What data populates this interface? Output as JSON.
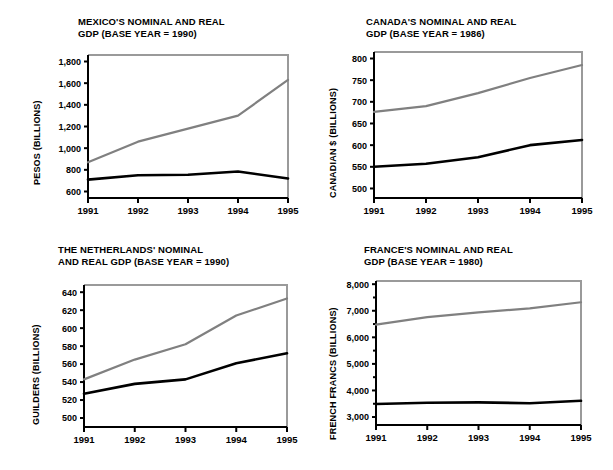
{
  "figure": {
    "background_color": "#ffffff",
    "nominal_series_color": "#808080",
    "real_series_color": "#000000",
    "axis_color": "#000000",
    "frame_color": "#9a9a9a"
  },
  "charts": [
    {
      "id": "mexico",
      "position": "top-left",
      "title": "MEXICO'S NOMINAL AND REAL\nGDP (BASE YEAR = 1990)",
      "ylabel": "PESOS (BILLIONS)",
      "xticklabels": [
        "1991",
        "1992",
        "1993",
        "1994",
        "1995"
      ],
      "yticklabels": [
        "600",
        "800",
        "1,000",
        "1,200",
        "1,400",
        "1,600",
        "1,800"
      ]
    },
    {
      "id": "canada",
      "position": "top-right",
      "title": "CANADA'S NOMINAL AND REAL\nGDP (BASE YEAR = 1986)",
      "ylabel": "CANADIAN $ (BILLIONS)",
      "xticklabels": [
        "1991",
        "1992",
        "1993",
        "1994",
        "1995"
      ],
      "yticklabels": [
        "500",
        "550",
        "600",
        "650",
        "700",
        "750",
        "800"
      ]
    },
    {
      "id": "netherlands",
      "position": "bottom-left",
      "title": "THE NETHERLANDS' NOMINAL\nAND REAL GDP (BASE YEAR = 1990)",
      "ylabel": "GUILDERS (BILLIONS)",
      "xticklabels": [
        "1991",
        "1992",
        "1993",
        "1994",
        "1995"
      ],
      "yticklabels": [
        "500",
        "520",
        "540",
        "560",
        "580",
        "600",
        "620",
        "640"
      ]
    },
    {
      "id": "france",
      "position": "bottom-right",
      "title": "FRANCE'S NOMINAL AND REAL\nGDP (BASE YEAR = 1980)",
      "ylabel": "FRENCH FRANCS (BILLIONS)",
      "xticklabels": [
        "1991",
        "1992",
        "1993",
        "1994",
        "1995"
      ],
      "yticklabels": [
        "3,000",
        "4,000",
        "5,000",
        "6,000",
        "7,000",
        "8,000"
      ]
    }
  ],
  "chart_data": [
    {
      "type": "line",
      "id": "mexico",
      "title": "MEXICO'S NOMINAL AND REAL GDP (BASE YEAR = 1990)",
      "xlabel": "",
      "ylabel": "PESOS (BILLIONS)",
      "x": [
        1991,
        1992,
        1993,
        1994,
        1995
      ],
      "categories": [
        "1991",
        "1992",
        "1993",
        "1994",
        "1995"
      ],
      "series": [
        {
          "name": "Nominal GDP",
          "color": "#808080",
          "values": [
            870,
            1060,
            1180,
            1300,
            1630
          ]
        },
        {
          "name": "Real GDP",
          "color": "#000000",
          "values": [
            710,
            750,
            755,
            785,
            720
          ]
        }
      ],
      "ylim": [
        540,
        1860
      ],
      "yticks": [
        600,
        800,
        1000,
        1200,
        1400,
        1600,
        1800
      ],
      "grid": false,
      "legend": "none"
    },
    {
      "type": "line",
      "id": "canada",
      "title": "CANADA'S NOMINAL AND REAL GDP (BASE YEAR = 1986)",
      "xlabel": "",
      "ylabel": "CANADIAN $ (BILLIONS)",
      "x": [
        1991,
        1992,
        1993,
        1994,
        1995
      ],
      "categories": [
        "1991",
        "1992",
        "1993",
        "1994",
        "1995"
      ],
      "series": [
        {
          "name": "Nominal GDP",
          "color": "#808080",
          "values": [
            677,
            690,
            720,
            755,
            785
          ]
        },
        {
          "name": "Real GDP",
          "color": "#000000",
          "values": [
            550,
            557,
            572,
            600,
            612
          ]
        }
      ],
      "ylim": [
        478,
        815
      ],
      "yticks": [
        500,
        550,
        600,
        650,
        700,
        750,
        800
      ],
      "grid": false,
      "legend": "none"
    },
    {
      "type": "line",
      "id": "netherlands",
      "title": "THE NETHERLANDS' NOMINAL AND REAL GDP (BASE YEAR = 1990)",
      "xlabel": "",
      "ylabel": "GUILDERS (BILLIONS)",
      "x": [
        1991,
        1992,
        1993,
        1994,
        1995
      ],
      "categories": [
        "1991",
        "1992",
        "1993",
        "1994",
        "1995"
      ],
      "series": [
        {
          "name": "Nominal GDP",
          "color": "#808080",
          "values": [
            543,
            565,
            582,
            614,
            633
          ]
        },
        {
          "name": "Real GDP",
          "color": "#000000",
          "values": [
            527,
            538,
            543,
            561,
            572
          ]
        }
      ],
      "ylim": [
        490,
        648
      ],
      "yticks": [
        500,
        520,
        540,
        560,
        580,
        600,
        620,
        640
      ],
      "grid": false,
      "legend": "none"
    },
    {
      "type": "line",
      "id": "france",
      "title": "FRANCE'S NOMINAL AND REAL GDP (BASE YEAR = 1980)",
      "xlabel": "",
      "ylabel": "FRENCH FRANCS (BILLIONS)",
      "x": [
        1991,
        1992,
        1993,
        1994,
        1995
      ],
      "categories": [
        "1991",
        "1992",
        "1993",
        "1994",
        "1995"
      ],
      "series": [
        {
          "name": "Nominal GDP",
          "color": "#808080",
          "values": [
            6480,
            6760,
            6940,
            7090,
            7320
          ]
        },
        {
          "name": "Real GDP",
          "color": "#000000",
          "values": [
            3490,
            3540,
            3550,
            3520,
            3610
          ]
        }
      ],
      "ylim": [
        2700,
        8120
      ],
      "yticks": [
        3000,
        4000,
        5000,
        6000,
        7000,
        8000
      ],
      "grid": false,
      "legend": "none"
    }
  ]
}
